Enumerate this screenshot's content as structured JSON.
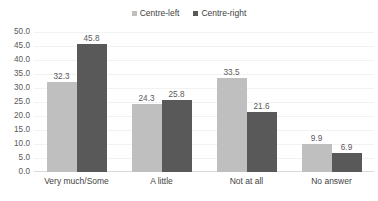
{
  "chart_data": {
    "type": "bar",
    "title": "",
    "subtitle": "",
    "xlabel": "",
    "ylabel": "",
    "categories": [
      "Very much/Some",
      "A little",
      "Not at all",
      "No answer"
    ],
    "series": [
      {
        "name": "Centre-left",
        "color": "#bfbfbf",
        "values": [
          32.3,
          24.3,
          33.5,
          9.9
        ],
        "labels": [
          "32.3",
          "24.3",
          "33.5",
          "9.9"
        ]
      },
      {
        "name": "Centre-right",
        "color": "#595959",
        "values": [
          45.8,
          25.8,
          21.6,
          6.9
        ],
        "labels": [
          "45.8",
          "25.8",
          "21.6",
          "6.9"
        ]
      }
    ],
    "ylim": [
      0,
      50
    ],
    "ytick_step": 5,
    "ytick_labels": [
      "50.0",
      "45.0",
      "40.0",
      "35.0",
      "30.0",
      "25.0",
      "20.0",
      "15.0",
      "10.0",
      "5.0",
      "0.0"
    ],
    "ytick_values": [
      50,
      45,
      40,
      35,
      30,
      25,
      20,
      15,
      10,
      5,
      0
    ],
    "grid": true,
    "grid_color": "#f2f2f2",
    "legend_position": "top-center",
    "data_labels": true,
    "background": "#ffffff"
  },
  "legend": {
    "items": [
      {
        "label": "Centre-left",
        "color": "#bfbfbf"
      },
      {
        "label": "Centre-right",
        "color": "#595959"
      }
    ]
  }
}
